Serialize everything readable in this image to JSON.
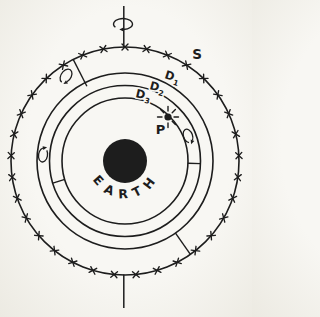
{
  "figure": {
    "labels": {
      "sphere_s": "S",
      "shell_d1": {
        "base": "D",
        "sub": "1"
      },
      "shell_d2": {
        "base": "D",
        "sub": "2"
      },
      "shell_d3": {
        "base": "D",
        "sub": "3"
      },
      "point_p": "P",
      "earth": "EARTH"
    },
    "symbols": {
      "rotation_indicator": "curved-arrow-loop",
      "point_marker": "starburst-dot",
      "outer_boundary_hatching": "x-tick-marks",
      "axis": "vertical-rotation-axis"
    },
    "colors": {
      "ink": "#1d1d1d",
      "paper": "#f8f7f3",
      "paper_edge": "#eceae2"
    }
  }
}
